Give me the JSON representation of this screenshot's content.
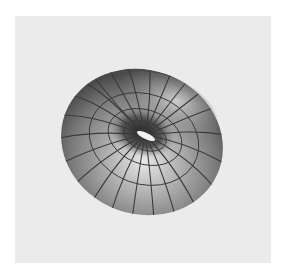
{
  "figure": {
    "background_color": "#ebebeb",
    "surface_color": "#9a9a9a",
    "line_color": "#3a3a3a"
  }
}
